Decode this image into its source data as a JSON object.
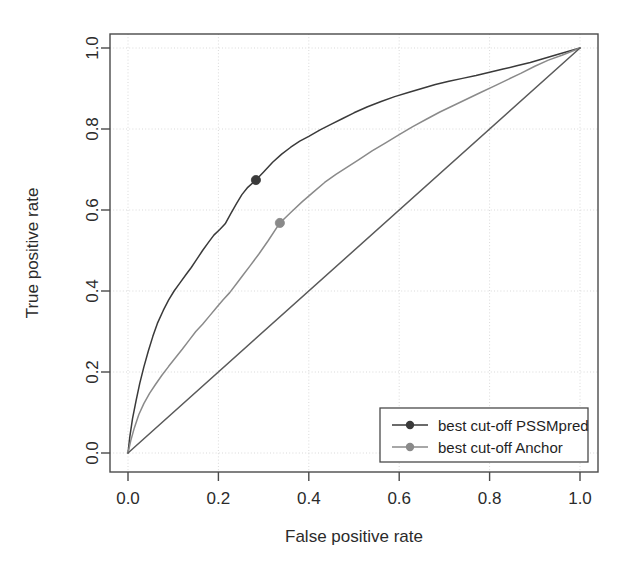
{
  "chart_data": {
    "type": "line",
    "title": "",
    "subtitle": "",
    "xlabel": "False positive rate",
    "ylabel": "True positive rate",
    "xlim": [
      0.0,
      1.0
    ],
    "ylim": [
      0.0,
      1.0
    ],
    "xticks": [
      "0.0",
      "0.2",
      "0.4",
      "0.6",
      "0.8",
      "1.0"
    ],
    "yticks": [
      "0.0",
      "0.2",
      "0.4",
      "0.6",
      "0.8",
      "1.0"
    ],
    "xtick_values": [
      0.0,
      0.2,
      0.4,
      0.6,
      0.8,
      1.0
    ],
    "ytick_values": [
      0.0,
      0.2,
      0.4,
      0.6,
      0.8,
      1.0
    ],
    "grid": true,
    "grid_style": "dotted",
    "legend_position": "bottom-right",
    "colors": {
      "pssmpred": "#3a3a3a",
      "anchor": "#8a8a8a",
      "diagonal": "#5a5a5a",
      "axis": "#4a4a4a",
      "grid": "#d9d9d9",
      "background": "#ffffff"
    },
    "series": [
      {
        "name": "PSSMpred",
        "legend_label": "best cut-off PSSMpred",
        "color": "#3a3a3a",
        "marker_point": {
          "x": 0.283,
          "y": 0.674
        },
        "x": [
          0.0,
          0.004,
          0.01,
          0.018,
          0.026,
          0.035,
          0.045,
          0.055,
          0.065,
          0.078,
          0.09,
          0.102,
          0.115,
          0.128,
          0.14,
          0.152,
          0.165,
          0.178,
          0.19,
          0.203,
          0.215,
          0.228,
          0.24,
          0.252,
          0.265,
          0.283,
          0.3,
          0.32,
          0.34,
          0.36,
          0.38,
          0.4,
          0.425,
          0.45,
          0.475,
          0.5,
          0.53,
          0.56,
          0.59,
          0.62,
          0.65,
          0.68,
          0.71,
          0.74,
          0.77,
          0.8,
          0.83,
          0.86,
          0.89,
          0.92,
          0.95,
          0.975,
          1.0
        ],
        "y": [
          0.0,
          0.04,
          0.085,
          0.13,
          0.172,
          0.212,
          0.252,
          0.288,
          0.32,
          0.352,
          0.378,
          0.4,
          0.42,
          0.44,
          0.458,
          0.478,
          0.5,
          0.52,
          0.538,
          0.552,
          0.566,
          0.592,
          0.616,
          0.638,
          0.656,
          0.674,
          0.694,
          0.718,
          0.738,
          0.755,
          0.77,
          0.782,
          0.798,
          0.812,
          0.826,
          0.84,
          0.855,
          0.868,
          0.88,
          0.89,
          0.9,
          0.91,
          0.918,
          0.925,
          0.932,
          0.94,
          0.948,
          0.956,
          0.964,
          0.974,
          0.984,
          0.992,
          1.0
        ]
      },
      {
        "name": "Anchor",
        "legend_label": "best cut-off Anchor",
        "color": "#8a8a8a",
        "marker_point": {
          "x": 0.336,
          "y": 0.568
        },
        "x": [
          0.0,
          0.006,
          0.014,
          0.024,
          0.035,
          0.048,
          0.06,
          0.075,
          0.09,
          0.105,
          0.12,
          0.135,
          0.15,
          0.165,
          0.18,
          0.195,
          0.21,
          0.225,
          0.24,
          0.255,
          0.27,
          0.29,
          0.31,
          0.336,
          0.36,
          0.385,
          0.41,
          0.435,
          0.46,
          0.485,
          0.51,
          0.54,
          0.57,
          0.6,
          0.63,
          0.66,
          0.69,
          0.72,
          0.75,
          0.78,
          0.81,
          0.84,
          0.87,
          0.9,
          0.93,
          0.96,
          1.0
        ],
        "y": [
          0.0,
          0.03,
          0.062,
          0.095,
          0.122,
          0.148,
          0.168,
          0.192,
          0.214,
          0.235,
          0.256,
          0.278,
          0.3,
          0.318,
          0.338,
          0.358,
          0.378,
          0.396,
          0.418,
          0.44,
          0.462,
          0.492,
          0.524,
          0.568,
          0.594,
          0.62,
          0.644,
          0.668,
          0.688,
          0.706,
          0.724,
          0.746,
          0.766,
          0.786,
          0.806,
          0.824,
          0.842,
          0.858,
          0.874,
          0.89,
          0.906,
          0.922,
          0.938,
          0.955,
          0.97,
          0.982,
          1.0
        ]
      },
      {
        "name": "Random (diagonal)",
        "legend_label": "",
        "color": "#5a5a5a",
        "marker_point": null,
        "x": [
          0.0,
          1.0
        ],
        "y": [
          0.0,
          1.0
        ]
      }
    ],
    "annotations": []
  },
  "legend": {
    "entries": [
      {
        "label": "best cut-off PSSMpred",
        "color": "#3a3a3a",
        "marker": "filled-circle"
      },
      {
        "label": "best cut-off Anchor",
        "color": "#8a8a8a",
        "marker": "filled-circle"
      }
    ]
  }
}
